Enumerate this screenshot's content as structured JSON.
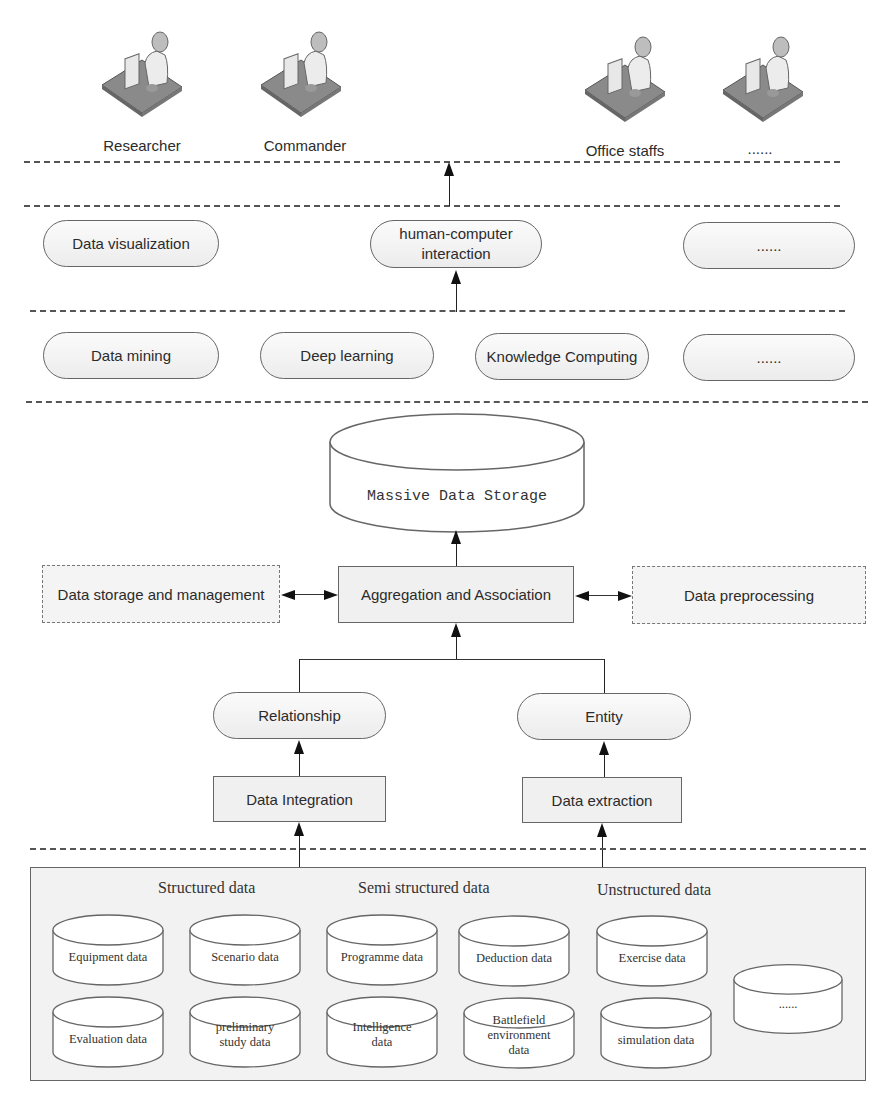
{
  "users": [
    {
      "label": "Researcher",
      "icon": "user-at-computer-icon"
    },
    {
      "label": "Commander",
      "icon": "user-at-computer-icon"
    },
    {
      "label": "Office staffs",
      "icon": "user-at-computer-icon"
    },
    {
      "label": "......",
      "icon": "user-at-computer-icon"
    }
  ],
  "application_layer": [
    {
      "label": "Data visualization"
    },
    {
      "label": "human-computer interaction"
    },
    {
      "label": "......"
    }
  ],
  "analysis_layer": [
    {
      "label": "Data mining"
    },
    {
      "label": "Deep learning"
    },
    {
      "label": "Knowledge Computing"
    },
    {
      "label": "......"
    }
  ],
  "storage": {
    "label": "Massive Data Storage"
  },
  "processing": {
    "center": "Aggregation and Association",
    "left": "Data storage and management",
    "right": "Data preprocessing",
    "relationship": "Relationship",
    "entity": "Entity",
    "integration": "Data Integration",
    "extraction": "Data extraction"
  },
  "data_sources": {
    "categories": [
      "Structured data",
      "Semi structured data",
      "Unstructured data"
    ],
    "row1": [
      "Equipment data",
      "Scenario data",
      "Programme data",
      "Deduction data",
      "Exercise data"
    ],
    "row2": [
      "Evaluation data",
      "preliminary study data",
      "Intelligence data",
      "Battlefield environment data",
      "simulation data"
    ],
    "more": "......"
  }
}
